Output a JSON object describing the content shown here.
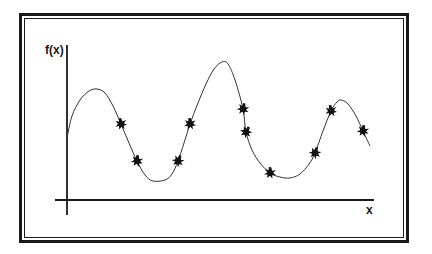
{
  "diagram": {
    "title": "",
    "axes": {
      "x_label": "x",
      "y_label": "f(x)"
    },
    "line_color": "#1a1a1a",
    "marker_color": "#111111",
    "marker_shape": "starburst"
  },
  "chart_data": {
    "type": "line",
    "title": "",
    "xlabel": "x",
    "ylabel": "f(x)",
    "grid": false,
    "legend": null,
    "curve_pixels": [
      [
        67,
        138
      ],
      [
        72,
        116
      ],
      [
        80,
        100
      ],
      [
        89,
        91
      ],
      [
        97,
        89
      ],
      [
        105,
        93
      ],
      [
        113,
        106
      ],
      [
        121,
        124
      ],
      [
        129,
        143
      ],
      [
        137,
        161
      ],
      [
        145,
        175
      ],
      [
        153,
        181
      ],
      [
        165,
        180
      ],
      [
        172,
        174
      ],
      [
        178,
        161
      ],
      [
        184,
        143
      ],
      [
        190,
        124
      ],
      [
        198,
        103
      ],
      [
        206,
        84
      ],
      [
        214,
        69
      ],
      [
        222,
        62
      ],
      [
        228,
        64
      ],
      [
        235,
        80
      ],
      [
        243,
        109
      ],
      [
        246,
        132
      ],
      [
        252,
        150
      ],
      [
        260,
        163
      ],
      [
        270,
        173
      ],
      [
        280,
        177
      ],
      [
        290,
        178
      ],
      [
        300,
        174
      ],
      [
        309,
        164
      ],
      [
        315,
        153
      ],
      [
        323,
        131
      ],
      [
        331,
        111
      ],
      [
        337,
        102
      ],
      [
        341,
        100
      ],
      [
        348,
        104
      ],
      [
        356,
        116
      ],
      [
        363,
        131
      ],
      [
        370,
        146
      ]
    ],
    "sample_points_pixels": [
      [
        121,
        124
      ],
      [
        137,
        161
      ],
      [
        178,
        161
      ],
      [
        190,
        124
      ],
      [
        243,
        109
      ],
      [
        246,
        132
      ],
      [
        270,
        173
      ],
      [
        315,
        153
      ],
      [
        331,
        111
      ],
      [
        363,
        131
      ]
    ],
    "sample_point_count": 10,
    "annotations": "Smooth oscillating function f(x) with three local maxima, sampled at 10 marked points"
  }
}
